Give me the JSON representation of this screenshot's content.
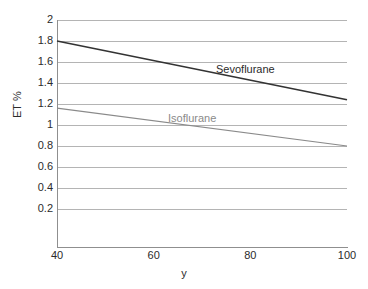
{
  "chart_data": {
    "type": "line",
    "title": "",
    "subtitle": "",
    "xlabel": "y",
    "ylabel": "ET %",
    "xlim": [
      40,
      100
    ],
    "ylim": [
      0,
      2
    ],
    "xticks": [
      40,
      60,
      80,
      100
    ],
    "xtick_labels": [
      "40",
      "60",
      "80",
      "100"
    ],
    "yticks": [
      0.2,
      0.4,
      0.6,
      0.8,
      1,
      1.2,
      1.4,
      1.6,
      1.8,
      2
    ],
    "ytick_labels": [
      "0.2",
      "0.4",
      "0.6",
      "0.8",
      "1",
      "1.2",
      "1.4",
      "1.6",
      "1.8",
      "2"
    ],
    "grid": "horizontal",
    "legend_position": "inline-annotation",
    "series": [
      {
        "name": "Sevoflurane",
        "color": "#333333",
        "x": [
          40,
          100
        ],
        "values": [
          1.8,
          1.24
        ]
      },
      {
        "name": "Isoflurane",
        "color": "#8a8a8a",
        "x": [
          40,
          100
        ],
        "values": [
          1.16,
          0.8
        ]
      }
    ],
    "annotations": [
      {
        "text": "Sevoflurane",
        "x": 80,
        "y": 1.55
      },
      {
        "text": "Isoflurane",
        "x": 68,
        "y": 1.09
      }
    ]
  },
  "axes": {
    "y_title": "ET %",
    "x_title": "y",
    "y_tick_0": "2",
    "y_tick_1": "1.8",
    "y_tick_2": "1.6",
    "y_tick_3": "1.4",
    "y_tick_4": "1.2",
    "y_tick_5": "1",
    "y_tick_6": "0.8",
    "y_tick_7": "0.6",
    "y_tick_8": "0.4",
    "y_tick_9": "0.2",
    "x_tick_0": "40",
    "x_tick_1": "60",
    "x_tick_2": "80",
    "x_tick_3": "100"
  },
  "labels": {
    "series_sevoflurane": "Sevoflurane",
    "series_isoflurane": "Isoflurane"
  },
  "colors": {
    "background": "#ffffff",
    "gridline": "#b4b4b4",
    "axis": "#8f8f8f",
    "text": "#2b2b2b",
    "sevoflurane": "#333333",
    "isoflurane": "#8a8a8a"
  }
}
